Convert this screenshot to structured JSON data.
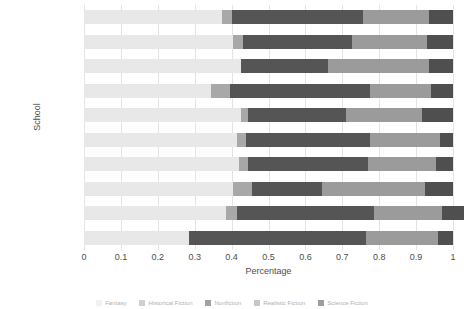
{
  "chart_data": {
    "type": "bar",
    "orientation": "horizontal",
    "stacked": true,
    "normalized": true,
    "title": "",
    "xlabel": "Percentage",
    "ylabel": "School",
    "xlim": [
      0,
      1
    ],
    "xticks": [
      "0",
      "0.1",
      "0.2",
      "0.3",
      "0.4",
      "0.5",
      "0.6",
      "0.7",
      "0.8",
      "0.9",
      "1"
    ],
    "xtick_values": [
      0,
      0.1,
      0.2,
      0.3,
      0.4,
      0.5,
      0.6,
      0.7,
      0.8,
      0.9,
      1
    ],
    "grid": "vertical",
    "legend_position": "bottom",
    "categories": [
      "West C",
      "Northeast C",
      "Southwest B",
      "Northeast B",
      "Northeast A",
      "Southwest A",
      "West B",
      "Southeast B",
      "West A",
      "Southeast A"
    ],
    "series": [
      {
        "name": "Fantasy",
        "color": "#e8e8e8",
        "values": [
          0.375,
          0.405,
          0.425,
          0.345,
          0.425,
          0.415,
          0.42,
          0.405,
          0.385,
          0.285
        ]
      },
      {
        "name": "Historical Fiction",
        "color": "#a8a8a8",
        "values": [
          0.025,
          0.025,
          0.0,
          0.05,
          0.02,
          0.025,
          0.025,
          0.05,
          0.03,
          0.0
        ]
      },
      {
        "name": "Nonfiction",
        "color": "#555555",
        "values": [
          0.355,
          0.295,
          0.235,
          0.38,
          0.265,
          0.335,
          0.325,
          0.19,
          0.37,
          0.48
        ]
      },
      {
        "name": "Realistic Fiction",
        "color": "#9b9b9b",
        "values": [
          0.18,
          0.205,
          0.275,
          0.165,
          0.205,
          0.19,
          0.185,
          0.28,
          0.185,
          0.195
        ]
      },
      {
        "name": "Science Fiction",
        "color": "#4f4f4f",
        "values": [
          0.065,
          0.07,
          0.065,
          0.06,
          0.085,
          0.035,
          0.045,
          0.075,
          0.06,
          0.04
        ]
      }
    ]
  },
  "axis": {
    "y_title": "School",
    "x_title": "Percentage"
  }
}
